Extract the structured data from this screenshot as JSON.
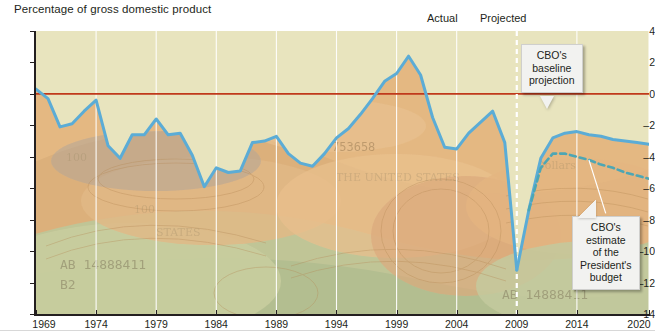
{
  "chart_data": {
    "type": "line",
    "title": "Percentage of gross domestic product",
    "xlabel": "",
    "ylabel": "Percentage of gross domestic product",
    "xlim": [
      1969,
      2020
    ],
    "ylim": [
      -14,
      4
    ],
    "ytick_step": 2,
    "yticks": [
      "4",
      "2",
      "0",
      "-2",
      "-4",
      "-6",
      "-8",
      "-10",
      "-12",
      "-14"
    ],
    "xticks": [
      "1969",
      "1974",
      "1979",
      "1984",
      "1989",
      "1994",
      "1999",
      "2004",
      "2009",
      "2014",
      "2020"
    ],
    "grid": "vertical-only-at-5yr-ticks",
    "legend": "none",
    "zero_reference_line": 0,
    "zero_line_color": "#c0391b",
    "line_color": "#5bacd6",
    "plot_background": "#e8e4be",
    "divider_year": 2009,
    "divider_style": "white-dashed-vertical",
    "annotations": [
      {
        "name": "actual",
        "text": "Actual",
        "x": 2006.5,
        "placement": "above-plot"
      },
      {
        "name": "projected",
        "text": "Projected",
        "x": 2011.5,
        "placement": "above-plot"
      },
      {
        "name": "baseline-callout",
        "text": "CBO's baseline projection",
        "points_to_year": 2013
      },
      {
        "name": "president-callout",
        "text": "CBO's estimate of the President's budget",
        "points_to_year": 2015
      }
    ],
    "series": [
      {
        "name": "Actual deficit/surplus",
        "style": "solid",
        "color": "#5bacd6",
        "x": [
          1969,
          1970,
          1971,
          1972,
          1973,
          1974,
          1975,
          1976,
          1977,
          1978,
          1979,
          1980,
          1981,
          1982,
          1983,
          1984,
          1985,
          1986,
          1987,
          1988,
          1989,
          1990,
          1991,
          1992,
          1993,
          1994,
          1995,
          1996,
          1997,
          1998,
          1999,
          2000,
          2001,
          2002,
          2003,
          2004,
          2005,
          2006,
          2007,
          2008,
          2009
        ],
        "values": [
          0.3,
          -0.3,
          -2.1,
          -1.9,
          -1.1,
          -0.4,
          -3.3,
          -4.1,
          -2.6,
          -2.6,
          -1.6,
          -2.6,
          -2.5,
          -3.9,
          -5.9,
          -4.7,
          -5.0,
          -4.9,
          -3.1,
          -3.0,
          -2.7,
          -3.8,
          -4.4,
          -4.6,
          -3.8,
          -2.8,
          -2.2,
          -1.3,
          -0.3,
          0.8,
          1.3,
          2.4,
          1.2,
          -1.5,
          -3.4,
          -3.5,
          -2.5,
          -1.8,
          -1.1,
          -3.1,
          -11.2
        ]
      },
      {
        "name": "CBO's baseline projection",
        "style": "solid",
        "color": "#5bacd6",
        "x": [
          2009,
          2010,
          2011,
          2012,
          2013,
          2014,
          2015,
          2016,
          2017,
          2018,
          2019,
          2020
        ],
        "values": [
          -11.2,
          -7.4,
          -4.1,
          -2.8,
          -2.5,
          -2.4,
          -2.6,
          -2.7,
          -2.9,
          -3.0,
          -3.1,
          -3.2
        ]
      },
      {
        "name": "CBO's estimate of the President's budget",
        "style": "dashed",
        "color": "#4da6b4",
        "x": [
          2010,
          2011,
          2012,
          2013,
          2014,
          2015,
          2016,
          2017,
          2018,
          2019,
          2020
        ],
        "values": [
          -7.4,
          -4.7,
          -3.8,
          -3.8,
          -4.0,
          -4.2,
          -4.5,
          -4.7,
          -5.0,
          -5.2,
          -5.4
        ]
      }
    ]
  },
  "header": {
    "title": "Percentage of gross domestic product"
  },
  "labels": {
    "actual": "Actual",
    "projected": "Projected"
  },
  "callouts": {
    "baseline": "CBO's\nbaseline\nprojection",
    "baseline_lines": [
      "CBO's",
      "baseline",
      "projection"
    ],
    "president": "CBO's\nestimate\nof the\nPresident's\nbudget",
    "president_lines": [
      "CBO's",
      "estimate",
      "of the",
      "President's",
      "budget"
    ]
  }
}
